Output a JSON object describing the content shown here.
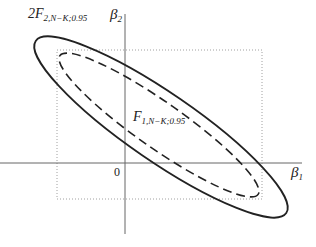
{
  "diagram": {
    "type": "confidence-regions",
    "axes": {
      "x_label": "β",
      "x_label_sub": "1",
      "y_label": "β",
      "y_label_sub": "2",
      "origin_label": "0"
    },
    "outer_region": {
      "style": "solid ellipse",
      "label_prefix": "2F",
      "label_sub": "2,N−K;0.95"
    },
    "inner_region": {
      "style": "dashed ellipse",
      "label_prefix": "F",
      "label_sub": "1,N−K;0.95"
    },
    "bounding_box": {
      "style": "dotted rectangle"
    },
    "colors": {
      "line": "#222222",
      "axis": "#555555",
      "dotted": "#888888"
    }
  }
}
